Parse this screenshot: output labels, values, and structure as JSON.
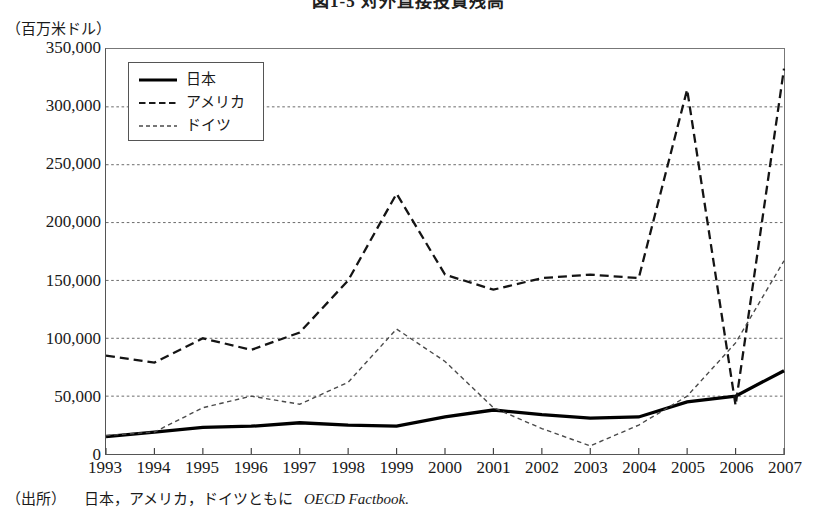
{
  "figure": {
    "title": "図1-5 対外直接投資残高",
    "unit_label": "（百万米ドル）",
    "source_prefix": "（出所）",
    "source_body": "日本，アメリカ，ドイツともに",
    "source_italic": "OECD Factbook."
  },
  "legend": {
    "position": "top-left-inside",
    "items": [
      {
        "label": "日本",
        "style": "solid",
        "color": "#000000"
      },
      {
        "label": "アメリカ",
        "style": "dashed",
        "color": "#1a1a1a"
      },
      {
        "label": "ドイツ",
        "style": "dotted",
        "color": "#4a4a4a"
      }
    ]
  },
  "chart_data": {
    "type": "line",
    "title": "図1-5 対外直接投資残高",
    "xlabel": "",
    "ylabel": "（百万米ドル）",
    "x": [
      1993,
      1994,
      1995,
      1996,
      1997,
      1998,
      1999,
      2000,
      2001,
      2002,
      2003,
      2004,
      2005,
      2006,
      2007
    ],
    "xtick_labels": [
      "1993",
      "1994",
      "1995",
      "1996",
      "1997",
      "1998",
      "1999",
      "2000",
      "2001",
      "2002",
      "2003",
      "2004",
      "2005",
      "2006",
      "2007"
    ],
    "ytick_labels": [
      "0",
      "50,000",
      "100,000",
      "150,000",
      "200,000",
      "250,000",
      "300,000",
      "350,000"
    ],
    "ytick_values": [
      0,
      50000,
      100000,
      150000,
      200000,
      250000,
      300000,
      350000
    ],
    "ylim": [
      0,
      350000
    ],
    "xlim": [
      1993,
      2007
    ],
    "grid": "horizontal-dotted",
    "series": [
      {
        "name": "日本",
        "style": "solid",
        "values": [
          15000,
          19000,
          23000,
          24000,
          27000,
          25000,
          24000,
          32000,
          38000,
          34000,
          31000,
          32000,
          45000,
          50000,
          72000
        ]
      },
      {
        "name": "アメリカ",
        "style": "dashed",
        "values": [
          85000,
          79000,
          100000,
          90000,
          105000,
          150000,
          225000,
          155000,
          142000,
          152000,
          155000,
          152000,
          315000,
          42000,
          333000
        ]
      },
      {
        "name": "ドイツ",
        "style": "dotted",
        "values": [
          16000,
          19000,
          40000,
          50000,
          43000,
          62000,
          108000,
          80000,
          40000,
          22000,
          7000,
          25000,
          50000,
          96000,
          167000
        ]
      }
    ],
    "series_note_america_order": [
      1993,
      1994,
      1995,
      1996,
      1997,
      1998,
      1999,
      2000,
      2001,
      2002,
      2003,
      2004,
      2005,
      2006,
      2007
    ]
  }
}
